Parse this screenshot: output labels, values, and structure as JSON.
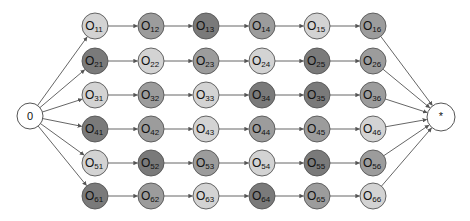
{
  "diagram": {
    "title": "",
    "shade_colors": {
      "L": "#d3d3d3",
      "M": "#9c9c9c",
      "D": "#7a7a7a"
    },
    "stroke_color": "#555555",
    "edge_color": "#555555",
    "start_node": {
      "label": "0",
      "x": 30,
      "y": 116,
      "r": 13
    },
    "end_node": {
      "label": "*",
      "x": 441,
      "y": 117,
      "r": 14
    },
    "columns_x": [
      95,
      151,
      206,
      262,
      317,
      373
    ],
    "rows_y": [
      26,
      61,
      95,
      129,
      163,
      196
    ],
    "node_radius": 13,
    "node_prefix": "O",
    "rows": [
      {
        "nodes": [
          {
            "sub": "11",
            "shade": "L"
          },
          {
            "sub": "12",
            "shade": "M"
          },
          {
            "sub": "13",
            "shade": "D"
          },
          {
            "sub": "14",
            "shade": "M"
          },
          {
            "sub": "15",
            "shade": "L"
          },
          {
            "sub": "16",
            "shade": "M"
          }
        ]
      },
      {
        "nodes": [
          {
            "sub": "21",
            "shade": "D"
          },
          {
            "sub": "22",
            "shade": "L"
          },
          {
            "sub": "23",
            "shade": "M"
          },
          {
            "sub": "24",
            "shade": "L"
          },
          {
            "sub": "25",
            "shade": "D"
          },
          {
            "sub": "26",
            "shade": "M"
          }
        ]
      },
      {
        "nodes": [
          {
            "sub": "31",
            "shade": "L"
          },
          {
            "sub": "32",
            "shade": "M"
          },
          {
            "sub": "33",
            "shade": "L"
          },
          {
            "sub": "34",
            "shade": "D"
          },
          {
            "sub": "35",
            "shade": "D"
          },
          {
            "sub": "36",
            "shade": "M"
          }
        ]
      },
      {
        "nodes": [
          {
            "sub": "41",
            "shade": "D"
          },
          {
            "sub": "42",
            "shade": "M"
          },
          {
            "sub": "43",
            "shade": "L"
          },
          {
            "sub": "44",
            "shade": "M"
          },
          {
            "sub": "45",
            "shade": "M"
          },
          {
            "sub": "46",
            "shade": "L"
          }
        ]
      },
      {
        "nodes": [
          {
            "sub": "51",
            "shade": "L"
          },
          {
            "sub": "52",
            "shade": "D"
          },
          {
            "sub": "53",
            "shade": "M"
          },
          {
            "sub": "54",
            "shade": "L"
          },
          {
            "sub": "55",
            "shade": "D"
          },
          {
            "sub": "56",
            "shade": "M"
          }
        ]
      },
      {
        "nodes": [
          {
            "sub": "61",
            "shade": "D"
          },
          {
            "sub": "62",
            "shade": "M"
          },
          {
            "sub": "63",
            "shade": "L"
          },
          {
            "sub": "64",
            "shade": "D"
          },
          {
            "sub": "65",
            "shade": "M"
          },
          {
            "sub": "66",
            "shade": "L"
          }
        ]
      }
    ]
  }
}
